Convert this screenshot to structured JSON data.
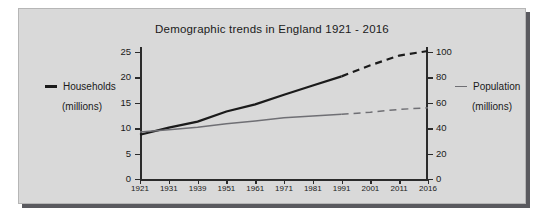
{
  "chart_data": {
    "type": "line",
    "title": "Demographic trends in England 1921 - 2016",
    "xlabel": "",
    "ylabel": "Households (millions)",
    "y2label": "Population (millions)",
    "grid": false,
    "legend_position": "outside-left-and-right",
    "categories": [
      "1921",
      "1931",
      "1939",
      "1951",
      "1961",
      "1971",
      "1981",
      "1991",
      "2001",
      "2011",
      "2016"
    ],
    "x_tick_labels": [
      "1921",
      "1931",
      "1939",
      "1951",
      "1961",
      "1971",
      "1981",
      "1991",
      "2001",
      "2011",
      "2016"
    ],
    "ylim": [
      0,
      25
    ],
    "y_ticks": [
      0,
      5,
      10,
      15,
      20,
      25
    ],
    "y_tick_labels": [
      "0",
      "5",
      "10",
      "15",
      "20",
      "25"
    ],
    "y2lim": [
      0,
      100
    ],
    "y2_ticks": [
      0,
      20,
      40,
      60,
      80,
      100
    ],
    "y2_tick_labels": [
      "0",
      "20",
      "40",
      "60",
      "80",
      "100"
    ],
    "series": [
      {
        "name": "Households",
        "units": "millions",
        "axis": "left",
        "color": "#1b1b1b",
        "solid_until": "1991",
        "projection_style": "dashed",
        "values": [
          8.7,
          10.1,
          11.3,
          13.3,
          14.7,
          16.6,
          18.4,
          20.2,
          22.4,
          24.3,
          25.2
        ]
      },
      {
        "name": "Population",
        "units": "millions",
        "axis": "right",
        "color": "#6f6f74",
        "solid_until": "1991",
        "projection_style": "dashed",
        "values": [
          37.0,
          38.8,
          40.7,
          43.5,
          45.7,
          48.2,
          49.6,
          51.0,
          52.6,
          54.8,
          56.1
        ]
      }
    ],
    "annotations": [
      "Solid lines show recorded data to 1991; dashed lines show projections to 2016."
    ]
  },
  "legend": {
    "left": {
      "name": "Households",
      "units": "(millions)",
      "swatch": "line-swatch-thick"
    },
    "right": {
      "name": "Population",
      "units": "(millions)",
      "swatch": "line-swatch-thin"
    }
  }
}
